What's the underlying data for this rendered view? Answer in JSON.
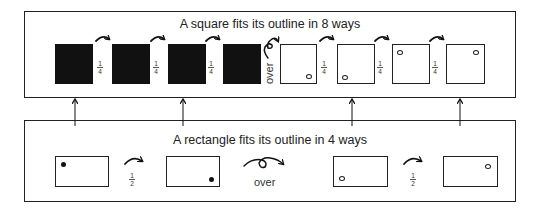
{
  "square_panel": {
    "title": "A square fits its outline in 8 ways",
    "turn_fraction_num": "1",
    "turn_fraction_den": "4",
    "flip_label": "over",
    "squares": [
      {
        "fill": "black",
        "mark": "none"
      },
      {
        "fill": "black",
        "mark": "none"
      },
      {
        "fill": "black",
        "mark": "none"
      },
      {
        "fill": "black",
        "mark": "none"
      },
      {
        "fill": "white",
        "mark": "bottom-right"
      },
      {
        "fill": "white",
        "mark": "bottom-left"
      },
      {
        "fill": "white",
        "mark": "top-left"
      },
      {
        "fill": "white",
        "mark": "top-right"
      }
    ]
  },
  "rectangle_panel": {
    "title": "A rectangle fits its outline in 4 ways",
    "turn_fraction_num": "1",
    "turn_fraction_den": "2",
    "flip_label": "over",
    "rectangles": [
      {
        "mark": "top-left",
        "mark_style": "filled"
      },
      {
        "mark": "bottom-right",
        "mark_style": "filled"
      },
      {
        "mark": "bottom-left",
        "mark_style": "hollow"
      },
      {
        "mark": "top-right",
        "mark_style": "hollow"
      }
    ]
  },
  "connectors": [
    {
      "from": "rectangle 1",
      "to": "square 1"
    },
    {
      "from": "rectangle 2",
      "to": "square 3"
    },
    {
      "from": "rectangle 3",
      "to": "square 6"
    },
    {
      "from": "rectangle 4",
      "to": "square 8"
    }
  ]
}
